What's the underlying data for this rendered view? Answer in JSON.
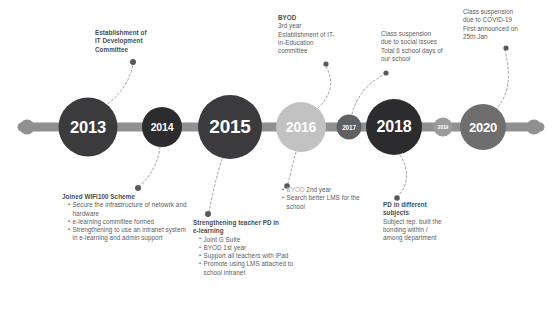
{
  "palette": {
    "dark": "#3b3b3d",
    "darker": "#2c2c2e",
    "light_gray": "#c2c2c2",
    "mid_gray": "#6e6e6e",
    "bar": "#8f9092",
    "text": "#5b5c5e",
    "dim_text": "#a9aaac"
  },
  "timeline": {
    "nodes": [
      {
        "label": "2013",
        "cx": 88,
        "r": 29.5,
        "color": "#3b3b3d",
        "font": 16.5
      },
      {
        "label": "2014",
        "cx": 162,
        "r": 20,
        "color": "#2c2c2e",
        "font": 10.5
      },
      {
        "label": "2015",
        "cx": 230,
        "r": 32,
        "color": "#3b3b3d",
        "font": 19
      },
      {
        "label": "2016",
        "cx": 301,
        "r": 25,
        "color": "#c2c2c2",
        "font": 14
      },
      {
        "label": "2017",
        "cx": 349,
        "r": 12.5,
        "color": "#5f6062",
        "font": 6.5
      },
      {
        "label": "2018",
        "cx": 394,
        "r": 28,
        "color": "#2c2c2e",
        "font": 16
      },
      {
        "label": "2019",
        "cx": 443,
        "r": 9.5,
        "color": "#9a9b9d",
        "font": 5
      },
      {
        "label": "2020",
        "cx": 483,
        "r": 23,
        "color": "#6e6e6e",
        "font": 13
      }
    ],
    "axis_y": 127,
    "bar_start": 22,
    "bar_end": 540,
    "cap_left_cx": 27,
    "cap_right_cx": 534,
    "cap_r": 7.5
  },
  "annotations": {
    "it_committee": {
      "lines": [
        "Establishment of",
        "IT Development",
        "Committee"
      ]
    },
    "wifi100": {
      "heading": "Joined WIFI100 Scheme",
      "bullets": [
        "Secure the infrastructure of netowrk and hardware",
        "e-learning committee formed",
        "Strengthening to use an intranet system in e-learning and admin support"
      ]
    },
    "teacher_pd": {
      "heading_lines": [
        "Strengthening teacher PD in",
        "e-learning"
      ],
      "bullets": [
        "Joint G Suite",
        "BYOD 1st year",
        "Support all teachers with iPad",
        "Promote using LMS attached to school intranet"
      ]
    },
    "byod_top": {
      "lines": [
        "BYOD",
        "3rd year",
        "Establishment of IT-",
        "in-Education",
        "committee"
      ]
    },
    "byod_bottom": {
      "bullets": [
        {
          "text": "BYOD 2nd year",
          "dim_prefix": "BYOD",
          "dim": true
        },
        {
          "text": "Search better LMS for the school",
          "dim": false
        }
      ]
    },
    "class_suspension_social": {
      "lines": [
        "Class suspension",
        "due to social issues",
        "Total 6 school days of",
        "our school"
      ]
    },
    "pd_subjects": {
      "heading_lines": [
        "PD in different",
        "subjects"
      ],
      "lines": [
        "Subject rep. built the",
        "bonding within /",
        "among department"
      ]
    },
    "covid": {
      "lines": [
        "Class suspension",
        "due to COVID-19",
        "First announced on",
        "25th Jan"
      ]
    }
  }
}
